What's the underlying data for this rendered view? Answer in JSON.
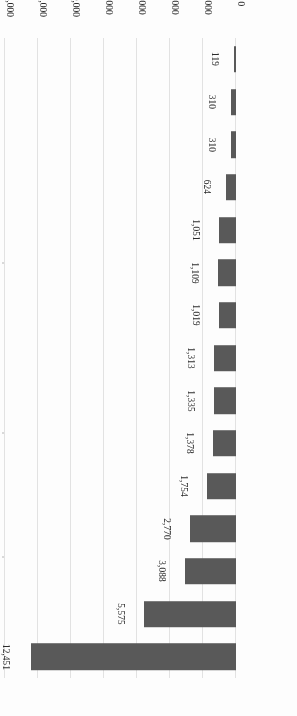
{
  "chart_data": {
    "type": "bar",
    "orientation": "horizontal",
    "title": "",
    "subtitle": "",
    "xlabel": "",
    "ylabel": "",
    "xlim": [
      0,
      14000
    ],
    "grid": true,
    "legend": null,
    "legend_position": "none",
    "bar_color": "#595959",
    "gridline_color": "#e2e2e2",
    "axis_color": "#bdbdbd",
    "page_rotation_degrees": 180,
    "xticks": [
      "0",
      "2,000",
      "4,000",
      "6,000",
      "8,000",
      "10,000",
      "12,000",
      "14,000"
    ],
    "xtick_values": [
      0,
      2000,
      4000,
      6000,
      8000,
      10000,
      12000,
      14000
    ],
    "categories": [
      "China",
      "Korea",
      "Malaysia",
      "UK",
      "Vietnam",
      "U.S.A",
      "Taiwan",
      "Hong Kong",
      "Singapore",
      "Thailand",
      "Japan",
      "Russia",
      "Israel",
      "France",
      "Canada"
    ],
    "values": [
      12451,
      5575,
      3088,
      2770,
      1754,
      1378,
      1335,
      1313,
      1019,
      1109,
      1051,
      624,
      310,
      310,
      119
    ],
    "data_labels": [
      "12,451",
      "5,575",
      "3,088",
      "2,770",
      "1,754",
      "1,378",
      "1,335",
      "1,313",
      "1,019",
      "1,109",
      "1,051",
      "624",
      "310",
      "310",
      "119"
    ]
  }
}
